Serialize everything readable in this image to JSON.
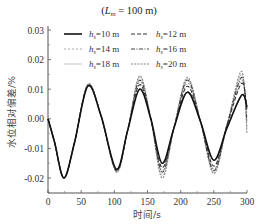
{
  "chart_data": {
    "type": "line",
    "title_parts": {
      "open": "(",
      "var": "L",
      "sub": "m",
      "rest": " = 100 m)"
    },
    "xlabel": "时间/s",
    "ylabel": "水位相对偏差/%",
    "xlim": [
      0,
      300
    ],
    "ylim": [
      -0.025,
      0.03
    ],
    "xticks": [
      0,
      50,
      100,
      150,
      200,
      250,
      300
    ],
    "xtick_labels": [
      "0",
      "50",
      "100",
      "150",
      "200",
      "250",
      "300"
    ],
    "yticks": [
      0.03,
      0.02,
      0.01,
      0.0,
      -0.01,
      -0.02
    ],
    "ytick_labels": [
      "0.03",
      "0.02",
      "0.01",
      "0.00",
      "-0.01",
      "-0.02"
    ],
    "grid": false,
    "legend_position": "upper center, 2 columns",
    "x": [
      0,
      10,
      24,
      40,
      60,
      80,
      103,
      120,
      138,
      155,
      172,
      190,
      210,
      230,
      250,
      270,
      292,
      300
    ],
    "series": [
      {
        "name": "h_s=10 m",
        "label_var": "h",
        "label_sub": "s",
        "label_rest": "=10 m",
        "color": "#111111",
        "width": 1.6,
        "dash": "",
        "values": [
          0.0,
          -0.008,
          -0.02,
          -0.008,
          0.011,
          0.001,
          -0.017,
          -0.004,
          0.01,
          0.0,
          -0.015,
          -0.003,
          0.009,
          -0.001,
          -0.014,
          -0.003,
          0.008,
          0.004
        ]
      },
      {
        "name": "h_s=12 m",
        "label_var": "h",
        "label_sub": "s",
        "label_rest": "=12 m",
        "color": "#333333",
        "width": 1.1,
        "dash": "4,2",
        "values": [
          0.0,
          -0.008,
          -0.02,
          -0.008,
          0.0112,
          0.001,
          -0.0172,
          -0.004,
          0.0115,
          0.0,
          -0.0165,
          -0.003,
          0.011,
          -0.001,
          -0.016,
          -0.002,
          0.012,
          0.003
        ]
      },
      {
        "name": "h_s=14 m",
        "label_var": "h",
        "label_sub": "s",
        "label_rest": "=14 m",
        "color": "#aaaaaa",
        "width": 1.1,
        "dash": "2,2",
        "values": [
          0.0,
          -0.008,
          -0.02,
          -0.008,
          0.0113,
          0.001,
          -0.0174,
          -0.004,
          0.0125,
          0.0,
          -0.0175,
          -0.003,
          0.012,
          -0.001,
          -0.017,
          -0.002,
          0.013,
          0.001
        ]
      },
      {
        "name": "h_s=16 m",
        "label_var": "h",
        "label_sub": "s",
        "label_rest": "=16 m",
        "color": "#444444",
        "width": 1.1,
        "dash": "4,1.5,1,1.5",
        "values": [
          0.0,
          -0.008,
          -0.02,
          -0.008,
          0.0114,
          0.001,
          -0.0176,
          -0.004,
          0.013,
          0.0,
          -0.018,
          -0.003,
          0.013,
          -0.001,
          -0.0175,
          -0.002,
          0.014,
          -0.001
        ]
      },
      {
        "name": "h_s=18 m",
        "label_var": "h",
        "label_sub": "s",
        "label_rest": "=18 m",
        "color": "#cccccc",
        "width": 1.1,
        "dash": "",
        "values": [
          0.0,
          -0.008,
          -0.02,
          -0.008,
          0.0115,
          0.001,
          -0.0178,
          -0.004,
          0.014,
          0.0,
          -0.019,
          -0.003,
          0.0135,
          -0.001,
          -0.018,
          -0.002,
          0.015,
          -0.003
        ]
      },
      {
        "name": "h_s=20 m",
        "label_var": "h",
        "label_sub": "s",
        "label_rest": "=20 m",
        "color": "#888888",
        "width": 1.1,
        "dash": "2,1.2",
        "values": [
          0.0,
          -0.008,
          -0.02,
          -0.008,
          0.0117,
          0.001,
          -0.018,
          -0.004,
          0.0145,
          0.0,
          -0.02,
          -0.003,
          0.014,
          -0.001,
          -0.0185,
          -0.002,
          0.016,
          -0.005
        ]
      }
    ]
  }
}
